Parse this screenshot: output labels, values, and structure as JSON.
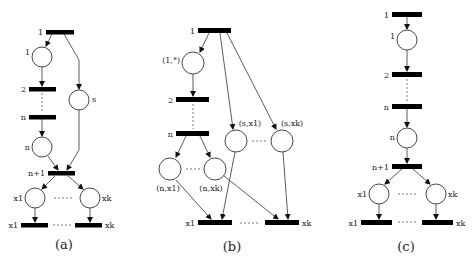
{
  "panels": [
    {
      "id": "a",
      "caption": "(a)",
      "transitions": [
        {
          "label": "1",
          "x": 46,
          "y": 30,
          "w": 28
        },
        {
          "label": "2",
          "x": 29,
          "y": 87,
          "w": 27
        },
        {
          "label": "n",
          "x": 29,
          "y": 115,
          "w": 27
        },
        {
          "label": "n+1",
          "x": 48,
          "y": 171,
          "w": 27
        },
        {
          "label": "x1",
          "x": 21,
          "y": 223,
          "w": 27
        },
        {
          "label": "xk",
          "x": 75,
          "y": 223,
          "w": 27
        }
      ],
      "places": [
        {
          "label": "1",
          "cx": 42,
          "cy": 57
        },
        {
          "label": "s",
          "cx": 79,
          "cy": 100
        },
        {
          "label": "n",
          "cx": 42,
          "cy": 147
        },
        {
          "label": "x1",
          "cx": 35,
          "cy": 198
        },
        {
          "label": "xk",
          "cx": 90,
          "cy": 198
        }
      ]
    },
    {
      "id": "b",
      "caption": "(b)",
      "transitions": [
        {
          "label": "1",
          "x": 198,
          "y": 28,
          "w": 33
        },
        {
          "label": "2",
          "x": 176,
          "y": 97,
          "w": 33
        },
        {
          "label": "n",
          "x": 176,
          "y": 131,
          "w": 33
        },
        {
          "label": "x1",
          "x": 198,
          "y": 220,
          "w": 34
        },
        {
          "label": "xk",
          "x": 265,
          "y": 220,
          "w": 34
        }
      ],
      "places": [
        {
          "label": "(1,*)",
          "cx": 193,
          "cy": 63
        },
        {
          "label": "(s,x1)",
          "cx": 236,
          "cy": 141
        },
        {
          "label": "(s,xk)",
          "cx": 282,
          "cy": 141
        },
        {
          "label": "(n,x1)",
          "cx": 170,
          "cy": 169
        },
        {
          "label": "(n,xk)",
          "cx": 215,
          "cy": 169
        }
      ]
    },
    {
      "id": "c",
      "caption": "(c)",
      "transitions": [
        {
          "label": "1",
          "x": 392,
          "y": 12,
          "w": 30
        },
        {
          "label": "2",
          "x": 392,
          "y": 72,
          "w": 30
        },
        {
          "label": "n",
          "x": 392,
          "y": 104,
          "w": 30
        },
        {
          "label": "n+1",
          "x": 392,
          "y": 164,
          "w": 30
        },
        {
          "label": "x1",
          "x": 361,
          "y": 220,
          "w": 31
        },
        {
          "label": "xk",
          "x": 422,
          "y": 220,
          "w": 31
        }
      ],
      "places": [
        {
          "label": "1",
          "cx": 407,
          "cy": 40
        },
        {
          "label": "n",
          "cx": 407,
          "cy": 138
        },
        {
          "label": "x1",
          "cx": 379,
          "cy": 194
        },
        {
          "label": "xk",
          "cx": 436,
          "cy": 194
        }
      ]
    }
  ]
}
